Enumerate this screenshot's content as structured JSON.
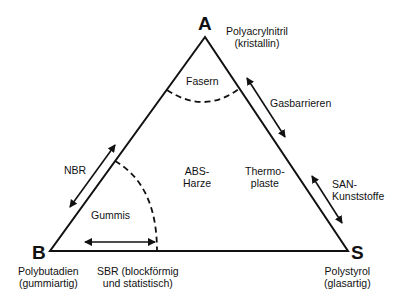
{
  "diagram": {
    "type": "ternary-triangle",
    "vertices": {
      "A": {
        "letter": "A",
        "line1": "Polyacrylnitril",
        "line2": "(kristallin)"
      },
      "B": {
        "letter": "B",
        "line1": "Polybutadien",
        "line2": "(gummiartig)"
      },
      "S": {
        "letter": "S",
        "line1": "Polystyrol",
        "line2": "(glasartig)"
      }
    },
    "regions": {
      "fasern": "Fasern",
      "gummis": "Gummis",
      "abs_line1": "ABS-",
      "abs_line2": "Harze",
      "thermo_line1": "Thermo-",
      "thermo_line2": "plaste"
    },
    "arrows": {
      "nbr": "NBR",
      "gasbarrieren": "Gasbarrieren",
      "san_line1": "SAN-",
      "san_line2": "Kunststoffe",
      "sbr_line1": "SBR (blockförmig",
      "sbr_line2": "und statistisch)"
    },
    "colors": {
      "line": "#111111",
      "background": "#ffffff"
    }
  }
}
